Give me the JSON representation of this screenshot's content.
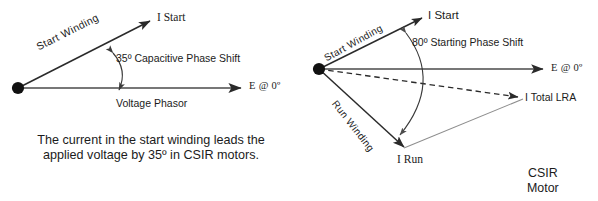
{
  "figure": {
    "background_color": "#ffffff",
    "ink_color": "#1b1b1b"
  },
  "left_diagram": {
    "name": "running-phase-shift-phasor",
    "origin_label": "origin-dot",
    "vectors": [
      {
        "name": "i-start",
        "label": "I Start",
        "angle_deg": 27,
        "style": "solid-arrow"
      },
      {
        "name": "voltage-phasor",
        "label": "E  @ 0º",
        "angle_deg": 0,
        "style": "solid-arrow"
      }
    ],
    "i_start_label": "I Start",
    "voltage_axis_label": "E  @ 0º",
    "start_winding_label": "Start  Winding",
    "voltage_phasor_label": "Voltage Phasor",
    "phase_shift_label": "35º Capacitive Phase Shift",
    "phase_shift_degrees": 35,
    "arc": {
      "name": "phase-shift-arc",
      "double_headed": true
    }
  },
  "caption": {
    "text": "The current in the start winding leads the applied voltage by 35º in CSIR motors."
  },
  "right_diagram": {
    "name": "starting-phase-shift-phasor",
    "origin_label": "origin-dot",
    "vectors": [
      {
        "name": "i-start",
        "label": "I Start",
        "angle_deg": 29,
        "style": "solid-arrow"
      },
      {
        "name": "voltage-axis",
        "label": "E  @ 0º",
        "angle_deg": 0,
        "style": "solid-arrow"
      },
      {
        "name": "i-total-lra",
        "label": "I Total LRA",
        "angle_deg": -17,
        "style": "dashed-arrow"
      },
      {
        "name": "i-run",
        "label": "I Run",
        "angle_deg": -52,
        "style": "solid-arrow"
      }
    ],
    "i_start_label": "I Start",
    "voltage_axis_label": "E  @ 0º",
    "i_total_lra_label": "I Total LRA",
    "i_run_label": "I Run",
    "start_winding_label": "Start  Winding",
    "run_winding_label": "Run Winding",
    "phase_shift_label": "80º Starting Phase Shift",
    "phase_shift_degrees": 80,
    "arc": {
      "name": "starting-phase-shift-arc",
      "double_headed": true
    },
    "resultant_leg": {
      "name": "parallelogram-leg",
      "style": "thin-solid"
    },
    "motor_type_label": "CSIR\nMotor",
    "motor_type_line1": "CSIR",
    "motor_type_line2": "Motor"
  }
}
